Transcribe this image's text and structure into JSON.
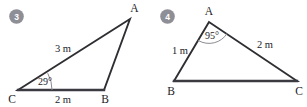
{
  "page": {
    "background_color": "#ffffff",
    "ink_color": "#2f2f33",
    "arc_color": "#8b8b93",
    "badge_color": "#8e8e96",
    "badge_text_color": "#ffffff"
  },
  "figures": [
    {
      "badge": "3",
      "vertices": {
        "A": "A",
        "B": "B",
        "C": "C"
      },
      "sides": {
        "CA": "3 m",
        "CB": "2 m"
      },
      "angles": {
        "C": "29°"
      }
    },
    {
      "badge": "4",
      "vertices": {
        "A": "A",
        "B": "B",
        "C": "C"
      },
      "sides": {
        "AB": "1 m",
        "AC": "2 m"
      },
      "angles": {
        "A": "95°"
      }
    }
  ]
}
